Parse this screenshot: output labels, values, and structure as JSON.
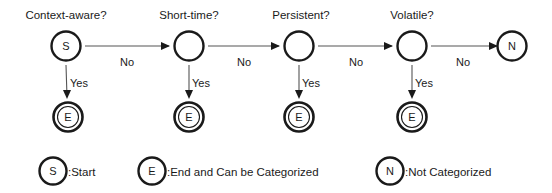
{
  "diagram": {
    "title_text": "",
    "colors": {
      "background": "#ffffff",
      "stroke": "#1a1a1a",
      "edge": "#555555"
    },
    "decision_nodes": [
      {
        "id": "context-aware",
        "question": "Context-aware?",
        "glyph": "S",
        "cx": 66,
        "cy": 46
      },
      {
        "id": "short-time",
        "question": "Short-time?",
        "glyph": "",
        "cx": 189,
        "cy": 46
      },
      {
        "id": "persistent",
        "question": "Persistent?",
        "glyph": "",
        "cx": 299,
        "cy": 46
      },
      {
        "id": "volatile",
        "question": "Volatile?",
        "glyph": "",
        "cx": 412,
        "cy": 46
      }
    ],
    "terminal_node": {
      "id": "not-categorized",
      "glyph": "N",
      "cx": 512,
      "cy": 46
    },
    "end_nodes": [
      {
        "id": "end-1",
        "glyph": "E",
        "cx": 68,
        "cy": 117
      },
      {
        "id": "end-2",
        "glyph": "E",
        "cx": 189,
        "cy": 117
      },
      {
        "id": "end-3",
        "glyph": "E",
        "cx": 299,
        "cy": 117
      },
      {
        "id": "end-4",
        "glyph": "E",
        "cx": 412,
        "cy": 117
      }
    ],
    "horizontal_edges": [
      {
        "id": "edge-no-1",
        "label": "No",
        "label_x": 127,
        "label_y": 62
      },
      {
        "id": "edge-no-2",
        "label": "No",
        "label_x": 244,
        "label_y": 62
      },
      {
        "id": "edge-no-3",
        "label": "No",
        "label_x": 356,
        "label_y": 62
      },
      {
        "id": "edge-no-4",
        "label": "No",
        "label_x": 463,
        "label_y": 62
      }
    ],
    "vertical_edges": [
      {
        "id": "edge-yes-1",
        "label": "Yes",
        "label_x": 75,
        "label_y": 83
      },
      {
        "id": "edge-yes-2",
        "label": "Yes",
        "label_x": 197,
        "label_y": 83
      },
      {
        "id": "edge-yes-3",
        "label": "Yes",
        "label_x": 307,
        "label_y": 83
      },
      {
        "id": "edge-yes-4",
        "label": "Yes",
        "label_x": 420,
        "label_y": 83
      }
    ],
    "legend": [
      {
        "id": "legend-start",
        "glyph": "S",
        "text": ":Start",
        "cx": 53,
        "cy": 171,
        "text_x": 68
      },
      {
        "id": "legend-end",
        "glyph": "E",
        "text": ":End and Can be Categorized",
        "cx": 152,
        "cy": 171,
        "text_x": 167
      },
      {
        "id": "legend-not-categorized",
        "glyph": "N",
        "text": ":Not Categorized",
        "cx": 390,
        "cy": 171,
        "text_x": 405
      }
    ]
  }
}
